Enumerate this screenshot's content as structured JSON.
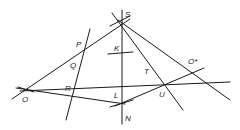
{
  "diagram": {
    "type": "projective-geometry-construction",
    "points": [
      {
        "id": "S",
        "label": "S",
        "x": 122,
        "y": 24,
        "lx": 125,
        "ly": 17
      },
      {
        "id": "P",
        "label": "P",
        "x": 86,
        "y": 48,
        "lx": 76,
        "ly": 47
      },
      {
        "id": "Q",
        "label": "Q",
        "x": 80,
        "y": 72,
        "lx": 70,
        "ly": 68
      },
      {
        "id": "R",
        "label": "R",
        "x": 73,
        "y": 97,
        "lx": 65,
        "ly": 91
      },
      {
        "id": "O",
        "label": "O",
        "x": 28,
        "y": 89,
        "lx": 22,
        "ly": 102
      },
      {
        "id": "K",
        "label": "K",
        "x": 122,
        "y": 56,
        "lx": 114,
        "ly": 51
      },
      {
        "id": "L",
        "label": "L",
        "x": 122,
        "y": 103,
        "lx": 114,
        "ly": 98
      },
      {
        "id": "N",
        "label": "N",
        "x": 122,
        "y": 120,
        "lx": 125,
        "ly": 121
      },
      {
        "id": "T",
        "label": "T",
        "x": 150,
        "y": 63,
        "lx": 144,
        "ly": 74
      },
      {
        "id": "U",
        "label": "U",
        "x": 166,
        "y": 83,
        "lx": 159,
        "ly": 97
      },
      {
        "id": "Ostar",
        "label": "O*",
        "x": 192,
        "y": 73,
        "lx": 188,
        "ly": 64
      }
    ],
    "lines": [
      {
        "name": "line-O-S",
        "x1": 12,
        "y1": 99,
        "x2": 130,
        "y2": 19
      },
      {
        "name": "line-O-K-Ostar",
        "x1": 20,
        "y1": 91,
        "x2": 230,
        "y2": 82
      },
      {
        "name": "line-O-L",
        "x1": 16,
        "y1": 88,
        "x2": 125,
        "y2": 104
      },
      {
        "name": "line-P-Q-R",
        "x1": 90,
        "y1": 29,
        "x2": 66,
        "y2": 120
      },
      {
        "name": "line-S-N",
        "x1": 122,
        "y1": 10,
        "x2": 122,
        "y2": 124
      },
      {
        "name": "line-S-T-U",
        "x1": 112,
        "y1": 13,
        "x2": 183,
        "y2": 110
      },
      {
        "name": "line-S-Ostar",
        "x1": 118,
        "y1": 20,
        "x2": 230,
        "y2": 100
      },
      {
        "name": "line-L-U-Ostar",
        "x1": 115,
        "y1": 106,
        "x2": 204,
        "y2": 68
      },
      {
        "name": "tick-K",
        "x1": 108,
        "y1": 54,
        "x2": 133,
        "y2": 52
      },
      {
        "name": "tick-L",
        "x1": 110,
        "y1": 107,
        "x2": 133,
        "y2": 100
      },
      {
        "name": "tick-S",
        "x1": 110,
        "y1": 26,
        "x2": 130,
        "y2": 16
      },
      {
        "name": "tick-O",
        "x1": 18,
        "y1": 87,
        "x2": 34,
        "y2": 92
      }
    ]
  }
}
